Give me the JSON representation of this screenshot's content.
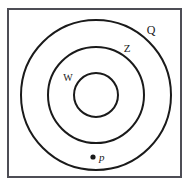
{
  "figure": {
    "background_color": "#ffffff",
    "frame": {
      "name": "outer-frame",
      "x": 8,
      "y": 9,
      "width": 173,
      "height": 168,
      "stroke_color": "#4d4d55",
      "stroke_width": 2,
      "fill": "#ffffff"
    },
    "circles": [
      {
        "label": "Q",
        "cx": 96,
        "cy": 95,
        "r": 75,
        "stroke_color": "#1a1a1a",
        "stroke_width": 2,
        "fill": "none"
      },
      {
        "label": "Z",
        "cx": 96,
        "cy": 95,
        "r": 48,
        "stroke_color": "#1a1a1a",
        "stroke_width": 2,
        "fill": "none"
      },
      {
        "label": "W",
        "cx": 96,
        "cy": 95,
        "r": 22,
        "stroke_color": "#1a1a1a",
        "stroke_width": 2,
        "fill": "none"
      }
    ],
    "labels": [
      {
        "name": "circle-label-q",
        "text": "Q",
        "x": 151,
        "y": 34,
        "font_size": 12,
        "font_style": "normal",
        "color": "#1a1a1a"
      },
      {
        "name": "circle-label-z",
        "text": "Z",
        "x": 127,
        "y": 52,
        "font_size": 11,
        "font_style": "normal",
        "color": "#1a1a1a"
      },
      {
        "name": "circle-label-w",
        "text": "W",
        "x": 68,
        "y": 81,
        "font_size": 10,
        "font_style": "normal",
        "color": "#1a1a1a"
      }
    ],
    "point": {
      "name": "point-p",
      "marker_x": 93,
      "marker_y": 157,
      "marker_radius": 2.6,
      "marker_color": "#1a1a1a",
      "label": "p",
      "label_x": 99,
      "label_y": 161,
      "label_font_size": 11,
      "label_font_style": "italic",
      "label_color": "#1a1a1a"
    }
  }
}
